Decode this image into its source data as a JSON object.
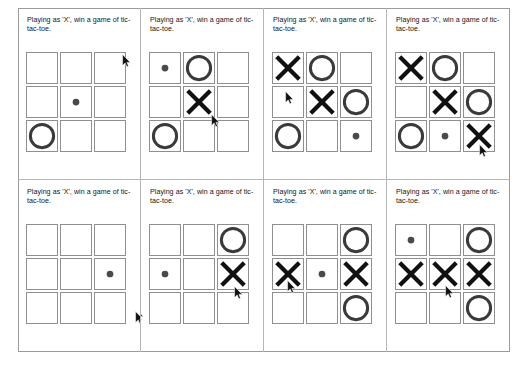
{
  "page": {
    "frame_border_color": "#9a9a9a",
    "panel_divider_color": "#b6b6b6",
    "background": "#ffffff",
    "rows": 2,
    "columns": 4
  },
  "caption_text": "Playing as 'X', win a game of tic-tac-toe.",
  "marks": {
    "x_label": "X",
    "o_label": "O",
    "dot_label": "dot",
    "empty_label": "empty",
    "x_color": "#111111",
    "o_color": "#3a3a3a",
    "dot_color": "#4a4a4a",
    "cell_border_color": "#8f8f8f"
  },
  "panels": [
    {
      "id": "panel-1",
      "index": 1,
      "caption": "Playing as 'X', win a game of tic-tac-toe.",
      "board": [
        [
          "empty",
          "empty",
          "empty"
        ],
        [
          "empty",
          "dot",
          "empty"
        ],
        [
          "O",
          "empty",
          "empty"
        ]
      ],
      "cursor": {
        "visible": true,
        "x": 104,
        "y": 46
      }
    },
    {
      "id": "panel-2",
      "index": 2,
      "caption": "Playing as 'X', win a game of tic-tac-toe.",
      "board": [
        [
          "dot",
          "O",
          "empty"
        ],
        [
          "empty",
          "X",
          "empty"
        ],
        [
          "O",
          "empty",
          "empty"
        ]
      ],
      "cursor": {
        "visible": true,
        "x": 70,
        "y": 106
      }
    },
    {
      "id": "panel-3",
      "index": 3,
      "caption": "Playing as 'X', win a game of tic-tac-toe.",
      "board": [
        [
          "X",
          "O",
          "empty"
        ],
        [
          "empty",
          "X",
          "O"
        ],
        [
          "O",
          "empty",
          "dot"
        ]
      ],
      "cursor": {
        "visible": true,
        "x": 21,
        "y": 83
      }
    },
    {
      "id": "panel-4",
      "index": 4,
      "caption": "Playing as 'X', win a game of tic-tac-toe.",
      "board": [
        [
          "X",
          "O",
          "empty"
        ],
        [
          "empty",
          "X",
          "O"
        ],
        [
          "O",
          "dot",
          "X"
        ]
      ],
      "cursor": {
        "visible": true,
        "x": 92,
        "y": 136
      }
    },
    {
      "id": "panel-5",
      "index": 5,
      "caption": "Playing as 'X', win a game of tic-tac-toe.",
      "board": [
        [
          "empty",
          "empty",
          "empty"
        ],
        [
          "empty",
          "empty",
          "dot"
        ],
        [
          "empty",
          "empty",
          "empty"
        ]
      ],
      "cursor": {
        "visible": true,
        "x": 117,
        "y": 131
      }
    },
    {
      "id": "panel-6",
      "index": 6,
      "caption": "Playing as 'X', win a game of tic-tac-toe.",
      "board": [
        [
          "empty",
          "empty",
          "O"
        ],
        [
          "dot",
          "empty",
          "X"
        ],
        [
          "empty",
          "empty",
          "empty"
        ]
      ],
      "cursor": {
        "visible": true,
        "x": 93,
        "y": 106
      }
    },
    {
      "id": "panel-7",
      "index": 7,
      "caption": "Playing as 'X', win a game of tic-tac-toe.",
      "board": [
        [
          "empty",
          "empty",
          "O"
        ],
        [
          "X",
          "dot",
          "X"
        ],
        [
          "empty",
          "empty",
          "O"
        ]
      ],
      "cursor": {
        "visible": true,
        "x": 23,
        "y": 100
      }
    },
    {
      "id": "panel-8",
      "index": 8,
      "caption": "Playing as 'X', win a game of tic-tac-toe.",
      "board": [
        [
          "dot",
          "empty",
          "O"
        ],
        [
          "X",
          "X",
          "X"
        ],
        [
          "empty",
          "empty",
          "O"
        ]
      ],
      "cursor": {
        "visible": true,
        "x": 58,
        "y": 105
      }
    }
  ],
  "extra_cursors": [
    {
      "id": "stray-cursor-panel-6",
      "panel": 6,
      "x": -6,
      "y": 128
    }
  ]
}
